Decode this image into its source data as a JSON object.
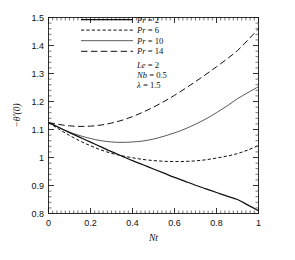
{
  "chart_data": {
    "type": "line",
    "title": "",
    "xlabel": "Nt",
    "ylabel": "−θ′(0)",
    "xlim": [
      0,
      1
    ],
    "ylim": [
      0.8,
      1.5
    ],
    "grid": false,
    "legend_position": "top-center",
    "xticks": [
      "0",
      "0.2",
      "0.4",
      "0.6",
      "0.8",
      "1"
    ],
    "xtick_values": [
      0,
      0.2,
      0.4,
      0.6,
      0.8,
      1
    ],
    "yticks": [
      "0.8",
      "0.9",
      "1",
      "1.1",
      "1.2",
      "1.3",
      "1.4",
      "1.5"
    ],
    "ytick_values": [
      0.8,
      0.9,
      1.0,
      1.1,
      1.2,
      1.3,
      1.4,
      1.5
    ],
    "x": [
      0,
      0.05,
      0.1,
      0.15,
      0.2,
      0.25,
      0.3,
      0.35,
      0.4,
      0.45,
      0.5,
      0.55,
      0.6,
      0.65,
      0.7,
      0.75,
      0.8,
      0.85,
      0.9,
      0.95,
      1
    ],
    "series": [
      {
        "name": "Pr = 2",
        "style": "solid",
        "width": 1.25,
        "values": [
          1.125,
          1.107,
          1.089,
          1.072,
          1.055,
          1.038,
          1.021,
          1.005,
          0.989,
          0.974,
          0.959,
          0.944,
          0.929,
          0.915,
          0.901,
          0.888,
          0.875,
          0.862,
          0.85,
          0.83,
          0.81
        ]
      },
      {
        "name": "Pr = 6",
        "style": "dashed-short",
        "width": 1.0,
        "values": [
          1.125,
          1.101,
          1.079,
          1.059,
          1.042,
          1.027,
          1.015,
          1.006,
          0.999,
          0.993,
          0.989,
          0.9865,
          0.9855,
          0.986,
          0.988,
          0.992,
          0.998,
          1.005,
          1.014,
          1.027,
          1.043
        ]
      },
      {
        "name": "Pr = 10",
        "style": "solid-thin",
        "width": 0.7,
        "values": [
          1.125,
          1.107,
          1.091,
          1.078,
          1.068,
          1.06,
          1.0555,
          1.054,
          1.0555,
          1.059,
          1.066,
          1.076,
          1.088,
          1.102,
          1.119,
          1.138,
          1.16,
          1.184,
          1.21,
          1.232,
          1.253
        ]
      },
      {
        "name": "Pr = 14",
        "style": "dashed-long",
        "width": 1.0,
        "values": [
          1.125,
          1.118,
          1.113,
          1.111,
          1.112,
          1.116,
          1.123,
          1.133,
          1.146,
          1.162,
          1.18,
          1.2,
          1.222,
          1.246,
          1.271,
          1.297,
          1.324,
          1.352,
          1.382,
          1.42,
          1.46
        ]
      }
    ],
    "annotations": [
      {
        "label": "Le = 2"
      },
      {
        "label": "Nb = 0.5"
      },
      {
        "label": "λ = 1.5"
      }
    ]
  }
}
